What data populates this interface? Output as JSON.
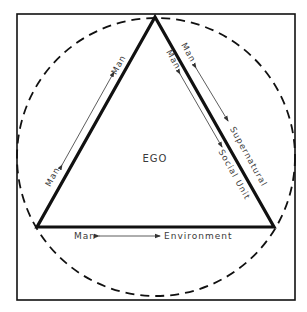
{
  "diagram": {
    "center_label": "EGO",
    "relations": [
      {
        "id": "left",
        "from": "Man",
        "to": "Man"
      },
      {
        "id": "right-outer",
        "from": "Man",
        "to": "Supernatural"
      },
      {
        "id": "right-inner",
        "from": "Man",
        "to": "Social Unit"
      },
      {
        "id": "bottom",
        "from": "Man",
        "to": "Environment"
      }
    ],
    "colors": {
      "stroke": "#111111",
      "text": "#3a3a3a",
      "background": "#ffffff"
    }
  }
}
